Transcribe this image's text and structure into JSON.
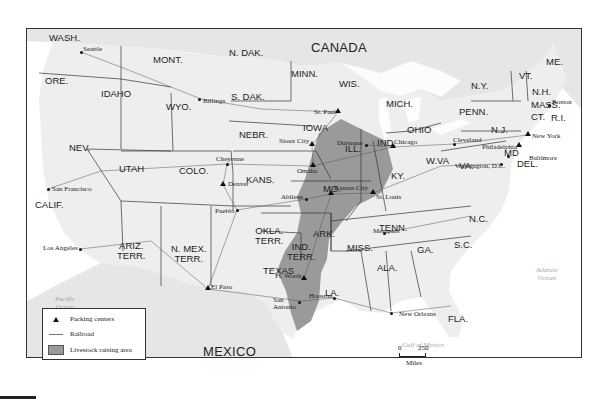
{
  "map": {
    "country_labels": {
      "canada": "CANADA",
      "mexico": "MEXICO"
    },
    "water_labels": {
      "pacific": "Pacific\nOcean",
      "atlantic": "Atlantic\nOcean",
      "gulf": "Gulf of Mexico"
    },
    "states": [
      {
        "id": "wash",
        "label": "WASH.",
        "x": 48,
        "y": 32
      },
      {
        "id": "ore",
        "label": "ORE.",
        "x": 44,
        "y": 75
      },
      {
        "id": "idaho",
        "label": "IDAHO",
        "x": 100,
        "y": 88
      },
      {
        "id": "mont",
        "label": "MONT.",
        "x": 152,
        "y": 54
      },
      {
        "id": "wyo",
        "label": "WYO.",
        "x": 165,
        "y": 101
      },
      {
        "id": "ndak",
        "label": "N. DAK.",
        "x": 228,
        "y": 47
      },
      {
        "id": "sdak",
        "label": "S. DAK.",
        "x": 230,
        "y": 91
      },
      {
        "id": "minn",
        "label": "MINN.",
        "x": 290,
        "y": 68
      },
      {
        "id": "wis",
        "label": "WIS.",
        "x": 338,
        "y": 78
      },
      {
        "id": "mich",
        "label": "MICH.",
        "x": 385,
        "y": 98
      },
      {
        "id": "nebr",
        "label": "NEBR.",
        "x": 238,
        "y": 129
      },
      {
        "id": "iowa",
        "label": "IOWA",
        "x": 302,
        "y": 122
      },
      {
        "id": "ill",
        "label": "ILL.",
        "x": 344,
        "y": 143
      },
      {
        "id": "ind",
        "label": "IND.",
        "x": 376,
        "y": 137
      },
      {
        "id": "ohio",
        "label": "OHIO",
        "x": 406,
        "y": 124
      },
      {
        "id": "nev",
        "label": "NEV.",
        "x": 68,
        "y": 142
      },
      {
        "id": "utah",
        "label": "UTAH",
        "x": 118,
        "y": 163
      },
      {
        "id": "colo",
        "label": "COLO.",
        "x": 178,
        "y": 165
      },
      {
        "id": "kans",
        "label": "KANS.",
        "x": 245,
        "y": 174
      },
      {
        "id": "mo",
        "label": "MO.",
        "x": 322,
        "y": 183
      },
      {
        "id": "ky",
        "label": "KY.",
        "x": 390,
        "y": 170
      },
      {
        "id": "wva",
        "label": "W.VA",
        "x": 425,
        "y": 155
      },
      {
        "id": "va",
        "label": "VA.",
        "x": 458,
        "y": 160
      },
      {
        "id": "calif",
        "label": "CALIF.",
        "x": 34,
        "y": 199
      },
      {
        "id": "ariz",
        "label": "ARIZ.\nTERR.",
        "x": 116,
        "y": 240
      },
      {
        "id": "nmex",
        "label": "N. MEX.\nTERR.",
        "x": 170,
        "y": 243
      },
      {
        "id": "okla",
        "label": "OKLA.\nTERR.",
        "x": 254,
        "y": 225
      },
      {
        "id": "ind_terr",
        "label": "IND.\nTERR.",
        "x": 286,
        "y": 241
      },
      {
        "id": "ark",
        "label": "ARK.",
        "x": 312,
        "y": 228
      },
      {
        "id": "tenn",
        "label": "TENN.",
        "x": 378,
        "y": 222
      },
      {
        "id": "nc",
        "label": "N.C.",
        "x": 468,
        "y": 213
      },
      {
        "id": "sc",
        "label": "S.C.",
        "x": 453,
        "y": 239
      },
      {
        "id": "ga",
        "label": "GA.",
        "x": 416,
        "y": 244
      },
      {
        "id": "ala",
        "label": "ALA.",
        "x": 376,
        "y": 262
      },
      {
        "id": "miss",
        "label": "MISS.",
        "x": 346,
        "y": 242
      },
      {
        "id": "la",
        "label": "LA.",
        "x": 324,
        "y": 287
      },
      {
        "id": "texas",
        "label": "TEXAS",
        "x": 262,
        "y": 265
      },
      {
        "id": "fla",
        "label": "FLA.",
        "x": 447,
        "y": 313
      },
      {
        "id": "ny",
        "label": "N.Y.",
        "x": 470,
        "y": 80
      },
      {
        "id": "penn",
        "label": "PENN.",
        "x": 458,
        "y": 106
      },
      {
        "id": "nj",
        "label": "N.J.",
        "x": 490,
        "y": 124
      },
      {
        "id": "md",
        "label": "MD",
        "x": 503,
        "y": 147
      },
      {
        "id": "del",
        "label": "DEL.",
        "x": 516,
        "y": 158
      },
      {
        "id": "vt",
        "label": "VT.",
        "x": 518,
        "y": 70
      },
      {
        "id": "nh",
        "label": "N.H.",
        "x": 531,
        "y": 86
      },
      {
        "id": "mass",
        "label": "MASS.",
        "x": 530,
        "y": 99
      },
      {
        "id": "ct",
        "label": "CT.",
        "x": 530,
        "y": 111
      },
      {
        "id": "ri",
        "label": "R.I.",
        "x": 550,
        "y": 112
      },
      {
        "id": "me",
        "label": "ME.",
        "x": 545,
        "y": 56
      }
    ],
    "cities": [
      {
        "name": "Seattle",
        "x": 80,
        "y": 51,
        "marker": "dot",
        "lx": 82,
        "ly": 45
      },
      {
        "name": "Billings",
        "x": 198,
        "y": 98,
        "marker": "dot",
        "lx": 202,
        "ly": 97
      },
      {
        "name": "St. Paul",
        "x": 337,
        "y": 111,
        "marker": "triangle",
        "lx": 313,
        "ly": 108
      },
      {
        "name": "Sioux City",
        "x": 311,
        "y": 144,
        "marker": "triangle",
        "lx": 278,
        "ly": 137
      },
      {
        "name": "Dubuque",
        "x": 365,
        "y": 144,
        "marker": "dot",
        "lx": 336,
        "ly": 139
      },
      {
        "name": "Chicago",
        "x": 392,
        "y": 146,
        "marker": "triangle",
        "lx": 393,
        "ly": 138
      },
      {
        "name": "Omaha",
        "x": 312,
        "y": 165,
        "marker": "triangle",
        "lx": 296,
        "ly": 167
      },
      {
        "name": "Cheyenne",
        "x": 226,
        "y": 163,
        "marker": "dot",
        "lx": 215,
        "ly": 155
      },
      {
        "name": "Denver",
        "x": 222,
        "y": 184,
        "marker": "triangle",
        "lx": 227,
        "ly": 180
      },
      {
        "name": "Kansas City",
        "x": 330,
        "y": 193,
        "marker": "triangle",
        "lx": 333,
        "ly": 184
      },
      {
        "name": "Abilene",
        "x": 305,
        "y": 198,
        "marker": "dot",
        "lx": 280,
        "ly": 193
      },
      {
        "name": "St. Louis",
        "x": 372,
        "y": 192,
        "marker": "triangle",
        "lx": 375,
        "ly": 193
      },
      {
        "name": "Pueblo",
        "x": 236,
        "y": 209,
        "marker": "dot",
        "lx": 214,
        "ly": 207
      },
      {
        "name": "San Francisco",
        "x": 47,
        "y": 188,
        "marker": "dot",
        "lx": 51,
        "ly": 185
      },
      {
        "name": "Los Angeles",
        "x": 79,
        "y": 248,
        "marker": "dot",
        "lx": 42,
        "ly": 244
      },
      {
        "name": "El Paso",
        "x": 207,
        "y": 288,
        "marker": "triangle",
        "lx": 210,
        "ly": 283
      },
      {
        "name": "Ft. Worth",
        "x": 303,
        "y": 278,
        "marker": "triangle",
        "lx": 274,
        "ly": 272
      },
      {
        "name": "San\nAntonio",
        "x": 298,
        "y": 301,
        "marker": "dot",
        "lx": 272,
        "ly": 296
      },
      {
        "name": "Houston",
        "x": 333,
        "y": 297,
        "marker": "dot",
        "lx": 308,
        "ly": 292
      },
      {
        "name": "Memphis",
        "x": 383,
        "y": 232,
        "marker": "dot",
        "lx": 372,
        "ly": 227
      },
      {
        "name": "New Orleans",
        "x": 390,
        "y": 312,
        "marker": "dot",
        "lx": 398,
        "ly": 310
      },
      {
        "name": "Cleveland",
        "x": 453,
        "y": 143,
        "marker": "dot",
        "lx": 452,
        "ly": 136
      },
      {
        "name": "New York",
        "x": 527,
        "y": 134,
        "marker": "triangle",
        "lx": 531,
        "ly": 132
      },
      {
        "name": "Philadelphia",
        "x": 518,
        "y": 145,
        "marker": "triangle",
        "lx": 481,
        "ly": 143
      },
      {
        "name": "Baltimore",
        "x": 507,
        "y": 155,
        "marker": "dot",
        "lx": 528,
        "ly": 154
      },
      {
        "name": "Washington, D.C.",
        "x": 500,
        "y": 163,
        "marker": "dot",
        "lx": 454,
        "ly": 162
      },
      {
        "name": "Boston",
        "x": 548,
        "y": 104,
        "marker": "dot",
        "lx": 551,
        "ly": 98
      }
    ]
  },
  "legend": {
    "items": [
      {
        "symbol": "triangle",
        "label": "Packing centers"
      },
      {
        "symbol": "line",
        "label": "Railroad"
      },
      {
        "symbol": "swatch",
        "label": "Livestock raising area"
      }
    ]
  },
  "scale": {
    "start": "0",
    "end": "250",
    "unit": "Miles"
  },
  "colors": {
    "land": "#eeeeee",
    "lakes": "#d0d0d0",
    "livestock": "#9a9a9a",
    "border": "#333333",
    "railroad": "#555555",
    "water": "#ffffff"
  }
}
